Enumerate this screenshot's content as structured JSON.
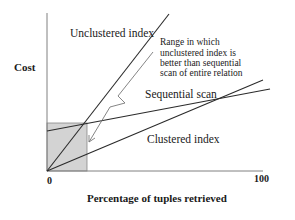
{
  "diagram": {
    "y_axis_label": "Cost",
    "x_axis_label": "Percentage of tuples retrieved",
    "x_tick_start": "0",
    "x_tick_end": "100",
    "curves": [
      {
        "name": "unclustered-index",
        "label": "Unclustered index"
      },
      {
        "name": "sequential-scan",
        "label": "Sequential scan"
      },
      {
        "name": "clustered-index",
        "label": "Clustered index"
      }
    ],
    "annotation": {
      "lines": [
        "Range in which",
        "unclustered index is",
        "better than sequential",
        "scan of entire relation"
      ]
    },
    "colors": {
      "shaded_region": "#d3d3d3",
      "lines": "#2a2a2a",
      "axis": "#808080"
    }
  }
}
